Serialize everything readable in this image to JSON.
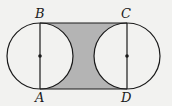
{
  "diagram": {
    "points": {
      "A": {
        "label": "A",
        "x": 40,
        "y": 89
      },
      "B": {
        "label": "B",
        "x": 40,
        "y": 23
      },
      "C": {
        "label": "C",
        "x": 127,
        "y": 23
      },
      "D": {
        "label": "D",
        "x": 127,
        "y": 89
      }
    },
    "circles": [
      {
        "name": "left-circle",
        "cx": 40,
        "cy": 56,
        "r": 33
      },
      {
        "name": "right-circle",
        "cx": 127,
        "cy": 56,
        "r": 33
      }
    ],
    "colors": {
      "background": "#f2f2f0",
      "shading": "#b4b4b4",
      "stroke": "#1a1a1a"
    }
  }
}
